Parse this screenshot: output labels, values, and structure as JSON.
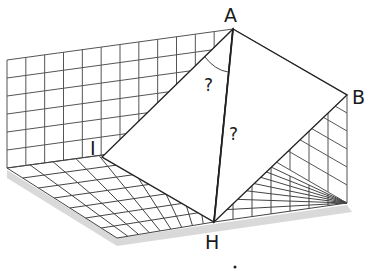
{
  "diagram": {
    "points": {
      "A": {
        "label": "A",
        "x": 233,
        "y": 29
      },
      "B": {
        "label": "B",
        "x": 347,
        "y": 95
      },
      "I": {
        "label": "I",
        "x": 102,
        "y": 157
      },
      "H": {
        "label": "H",
        "x": 214,
        "y": 222
      }
    },
    "angle_labels": [
      {
        "text": "?",
        "x": 210,
        "y": 85,
        "meaning": "angle IAH"
      },
      {
        "text": "?",
        "x": 236,
        "y": 133,
        "meaning": "length AH"
      }
    ],
    "colors": {
      "line": "#222222",
      "grid": "#555555",
      "shadow": "#c8c8c8"
    }
  }
}
